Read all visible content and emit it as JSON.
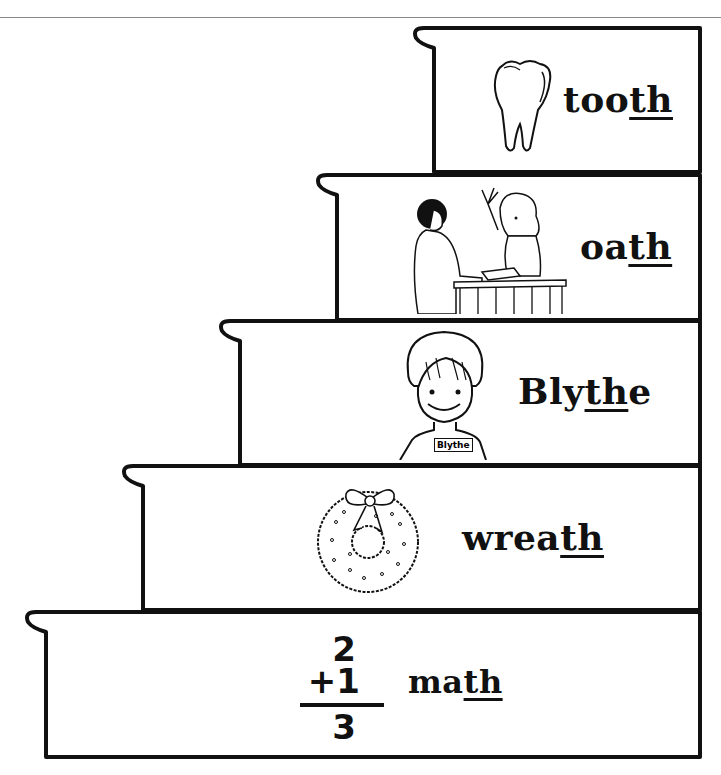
{
  "worksheet": {
    "title": "th words staircase",
    "accent_color": "#111111",
    "steps": [
      {
        "word_prefix": "too",
        "word_digraph": "th",
        "word_suffix": "",
        "icon": "tooth-icon"
      },
      {
        "word_prefix": "oa",
        "word_digraph": "th",
        "word_suffix": "",
        "icon": "swearing-oath-icon"
      },
      {
        "word_prefix": "Bly",
        "word_digraph": "th",
        "word_suffix": "e",
        "icon": "child-blythe-icon",
        "nametag": "Blythe"
      },
      {
        "word_prefix": "wrea",
        "word_digraph": "th",
        "word_suffix": "",
        "icon": "wreath-icon"
      },
      {
        "word_prefix": "ma",
        "word_digraph": "th",
        "word_suffix": "",
        "icon": "addition-problem-icon",
        "math": {
          "top": "2",
          "addend": "+1",
          "sum": "3"
        }
      }
    ]
  }
}
